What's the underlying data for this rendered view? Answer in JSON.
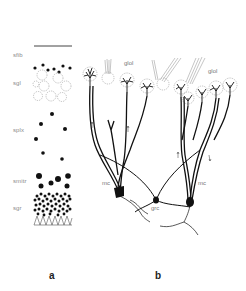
{
  "figure": {
    "panel_a": {
      "label": "a",
      "layers": [
        {
          "abbr": "sfib"
        },
        {
          "abbr": "sgl"
        },
        {
          "abbr": "splx"
        },
        {
          "abbr": "smitr"
        },
        {
          "abbr": "sgr"
        }
      ]
    },
    "panel_b": {
      "label": "b",
      "labels": {
        "glomerulus_left": "glol",
        "glomerulus_right": "glol",
        "mitral_left": "mc",
        "mitral_right": "mc",
        "granule": "grc"
      }
    },
    "colors": {
      "ink": "#111111",
      "outline": "#9a9a9a",
      "label_text": "#8a8a8a",
      "background": "#ffffff"
    }
  }
}
